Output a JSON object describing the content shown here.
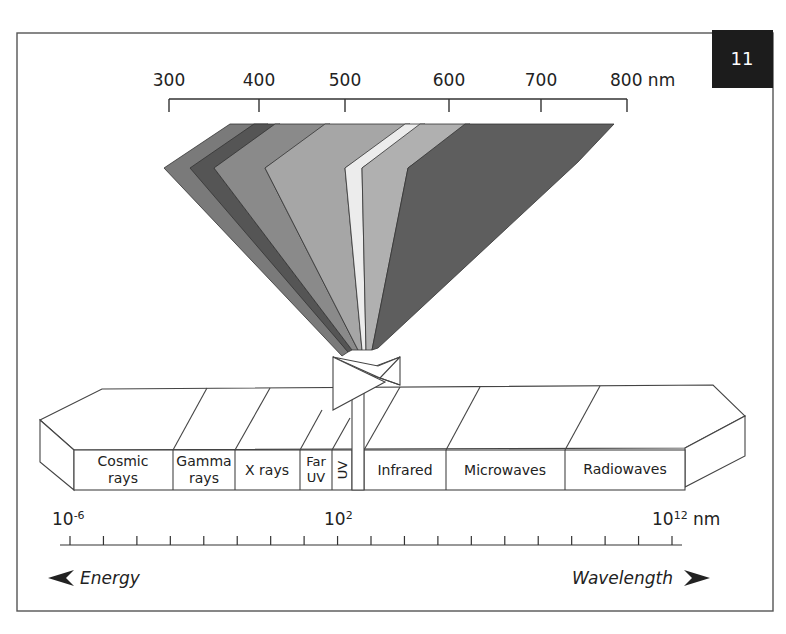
{
  "figure": {
    "badge": "11",
    "frame_stroke": "#555555"
  },
  "visible_scale": {
    "unit": "nm",
    "ticks": [
      {
        "label": "300",
        "value": 300
      },
      {
        "label": "400",
        "value": 400
      },
      {
        "label": "500",
        "value": 500
      },
      {
        "label": "600",
        "value": 600
      },
      {
        "label": "700",
        "value": 700
      },
      {
        "label": "800 nm",
        "value": 800
      }
    ]
  },
  "visible_fan": {
    "bands": [
      {
        "name": "violet",
        "shade": "#7a7a7a"
      },
      {
        "name": "indigo",
        "shade": "#555555"
      },
      {
        "name": "blue",
        "shade": "#8a8a8a"
      },
      {
        "name": "green",
        "shade": "#a6a6a6"
      },
      {
        "name": "yellow",
        "shade": "#ececec"
      },
      {
        "name": "orange",
        "shade": "#b0b0b0"
      },
      {
        "name": "red",
        "shade": "#5e5e5e"
      }
    ]
  },
  "spectrum_bar": {
    "segments": [
      {
        "label_line1": "Cosmic",
        "label_line2": "rays"
      },
      {
        "label_line1": "Gamma",
        "label_line2": "rays"
      },
      {
        "label_line1": "X rays",
        "label_line2": ""
      },
      {
        "label_line1": "Far",
        "label_line2": "UV"
      },
      {
        "label_line1": "UV",
        "label_line2": ""
      },
      {
        "label_line1": "",
        "label_line2": ""
      },
      {
        "label_line1": "Infrared",
        "label_line2": ""
      },
      {
        "label_line1": "Microwaves",
        "label_line2": ""
      },
      {
        "label_line1": "Radiowaves",
        "label_line2": ""
      }
    ]
  },
  "wavelength_scale": {
    "left_label_base": "10",
    "left_label_exp": "-6",
    "mid_label_base": "10",
    "mid_label_exp": "2",
    "right_label_base": "10",
    "right_label_exp": "12",
    "right_unit": " nm",
    "tick_count": 19
  },
  "captions": {
    "energy": "Energy",
    "wavelength": "Wavelength"
  }
}
